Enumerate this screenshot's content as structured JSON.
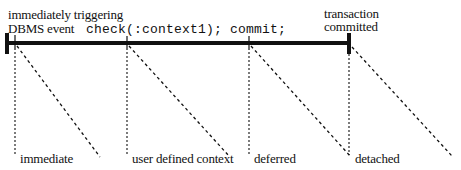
{
  "top_labels": {
    "start_line1": "immediately triggering",
    "start_line2": "DBMS event",
    "check": "check(:context1);",
    "commit": "commit;",
    "end_line1": "transaction",
    "end_line2": "committed"
  },
  "bottom_labels": {
    "immediate": "immediate",
    "user_defined": "user defined context",
    "deferred": "deferred",
    "detached": "detached"
  },
  "colors": {
    "ink": "#111111",
    "background": "#ffffff"
  }
}
